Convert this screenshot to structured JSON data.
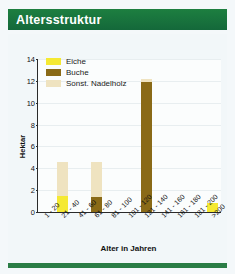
{
  "header": {
    "title": "Altersstruktur"
  },
  "chart_data": {
    "type": "bar",
    "title": "Altersstruktur",
    "xlabel": "Alter in Jahren",
    "ylabel": "Hektar",
    "ylim": [
      0,
      14
    ],
    "yticks": [
      0,
      2,
      4,
      6,
      8,
      10,
      12,
      14
    ],
    "grid": true,
    "stacked": true,
    "legend_position": "top-left",
    "categories": [
      "1 - 20",
      "21 - 40",
      "41 - 60",
      "61 - 80",
      "81 - 100",
      "101 - 120",
      "121 - 140",
      "141 - 160",
      "161 - 180",
      "181 - 200",
      ">200"
    ],
    "series": [
      {
        "name": "Eiche",
        "color": "#f5e932",
        "values": [
          0,
          1.5,
          0,
          0,
          0,
          0,
          0,
          0,
          0,
          0,
          0.8
        ]
      },
      {
        "name": "Buche",
        "color": "#8a6a17",
        "values": [
          0,
          0,
          0,
          1.4,
          0,
          0,
          11.9,
          0,
          0,
          0,
          0
        ]
      },
      {
        "name": "Sonst. Nadelholz",
        "color": "#efe3c0",
        "values": [
          0,
          3.1,
          0,
          3.2,
          0,
          0,
          0.3,
          0,
          0,
          0,
          0
        ]
      }
    ],
    "totals": [
      0,
      4.6,
      0,
      4.6,
      0,
      0,
      12.2,
      0,
      0,
      0,
      0.8
    ]
  },
  "colors": {
    "banner_green": "#1b7a3d",
    "rule_green": "#2b7d46",
    "eiche": "#f5e932",
    "buche": "#8a6a17",
    "nadelholz": "#efe3c0",
    "axis": "#2a2a2a"
  }
}
